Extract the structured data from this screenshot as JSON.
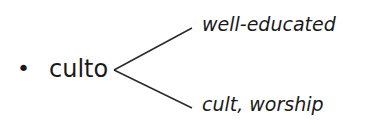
{
  "item": {
    "bullet": "•",
    "word": "culto",
    "meanings": [
      "well-educated",
      "cult, worship"
    ]
  }
}
